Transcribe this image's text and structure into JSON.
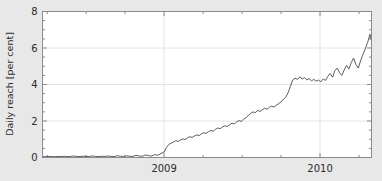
{
  "chart_data": {
    "type": "line",
    "title": "",
    "xlabel": "",
    "ylabel": "Daily reach [per cent]",
    "ylim": [
      0,
      8
    ],
    "xlim": [
      2008.22,
      2010.33
    ],
    "grid": true,
    "legend": null,
    "y_ticks": [
      0,
      2,
      4,
      6,
      8
    ],
    "y_tick_labels": [
      "0",
      "2",
      "4",
      "6",
      "8"
    ],
    "y_minor_tick_step": 0.5,
    "x_ticks": [
      2009,
      2010
    ],
    "x_tick_labels": [
      "2009",
      "2010"
    ],
    "x_minor_tick_step": 0.25,
    "line_color": "#4a4a4a",
    "grid_color": "#e4e4e4",
    "axes_color": "#8a8a8a",
    "plot_bg": "#ffffff",
    "figure_bg": "#e8e8e8",
    "series": [
      {
        "name": "Daily reach",
        "x": [
          2008.22,
          2008.24,
          2008.26,
          2008.28,
          2008.3,
          2008.32,
          2008.34,
          2008.36,
          2008.38,
          2008.4,
          2008.42,
          2008.44,
          2008.46,
          2008.48,
          2008.5,
          2008.52,
          2008.54,
          2008.56,
          2008.58,
          2008.6,
          2008.62,
          2008.64,
          2008.66,
          2008.68,
          2008.7,
          2008.72,
          2008.74,
          2008.76,
          2008.78,
          2008.8,
          2008.82,
          2008.84,
          2008.86,
          2008.88,
          2008.9,
          2008.92,
          2008.94,
          2008.96,
          2008.98,
          2009.0,
          2009.015,
          2009.03,
          2009.045,
          2009.06,
          2009.075,
          2009.09,
          2009.105,
          2009.12,
          2009.135,
          2009.15,
          2009.165,
          2009.18,
          2009.195,
          2009.21,
          2009.225,
          2009.24,
          2009.255,
          2009.27,
          2009.285,
          2009.3,
          2009.315,
          2009.33,
          2009.345,
          2009.36,
          2009.375,
          2009.39,
          2009.405,
          2009.42,
          2009.435,
          2009.45,
          2009.465,
          2009.48,
          2009.495,
          2009.51,
          2009.525,
          2009.54,
          2009.555,
          2009.57,
          2009.585,
          2009.6,
          2009.615,
          2009.63,
          2009.645,
          2009.66,
          2009.675,
          2009.69,
          2009.705,
          2009.72,
          2009.735,
          2009.75,
          2009.765,
          2009.78,
          2009.795,
          2009.81,
          2009.825,
          2009.84,
          2009.855,
          2009.87,
          2009.885,
          2009.9,
          2009.915,
          2009.93,
          2009.945,
          2009.96,
          2009.975,
          2009.99,
          2010.005,
          2010.02,
          2010.035,
          2010.05,
          2010.065,
          2010.08,
          2010.095,
          2010.11,
          2010.125,
          2010.14,
          2010.155,
          2010.17,
          2010.185,
          2010.2,
          2010.215,
          2010.23,
          2010.245,
          2010.26,
          2010.275,
          2010.29,
          2010.305,
          2010.32,
          2010.33
        ],
        "y": [
          0.05,
          0.04,
          0.06,
          0.05,
          0.04,
          0.06,
          0.05,
          0.07,
          0.05,
          0.06,
          0.08,
          0.06,
          0.05,
          0.07,
          0.06,
          0.05,
          0.09,
          0.06,
          0.05,
          0.07,
          0.06,
          0.08,
          0.06,
          0.05,
          0.1,
          0.07,
          0.06,
          0.09,
          0.07,
          0.06,
          0.12,
          0.08,
          0.07,
          0.14,
          0.1,
          0.08,
          0.16,
          0.12,
          0.22,
          0.3,
          0.55,
          0.72,
          0.78,
          0.85,
          0.92,
          0.88,
          0.96,
          1.02,
          0.98,
          1.08,
          1.14,
          1.1,
          1.18,
          1.24,
          1.2,
          1.3,
          1.36,
          1.32,
          1.42,
          1.48,
          1.44,
          1.55,
          1.62,
          1.58,
          1.68,
          1.74,
          1.7,
          1.8,
          1.88,
          1.84,
          1.95,
          2.02,
          1.98,
          2.1,
          2.18,
          2.3,
          2.42,
          2.5,
          2.46,
          2.58,
          2.52,
          2.62,
          2.7,
          2.64,
          2.75,
          2.82,
          2.76,
          2.88,
          2.95,
          3.05,
          3.18,
          3.3,
          3.55,
          3.9,
          4.25,
          4.35,
          4.28,
          4.42,
          4.3,
          4.38,
          4.26,
          4.32,
          4.2,
          4.28,
          4.18,
          4.24,
          4.15,
          4.3,
          4.22,
          4.45,
          4.6,
          4.4,
          4.75,
          4.9,
          4.65,
          4.5,
          4.8,
          5.05,
          4.85,
          5.2,
          5.45,
          5.1,
          4.9,
          5.3,
          5.65,
          5.95,
          6.3,
          6.75,
          6.4
        ]
      }
    ]
  },
  "axis": {
    "y_label": "Daily reach [per cent]"
  }
}
